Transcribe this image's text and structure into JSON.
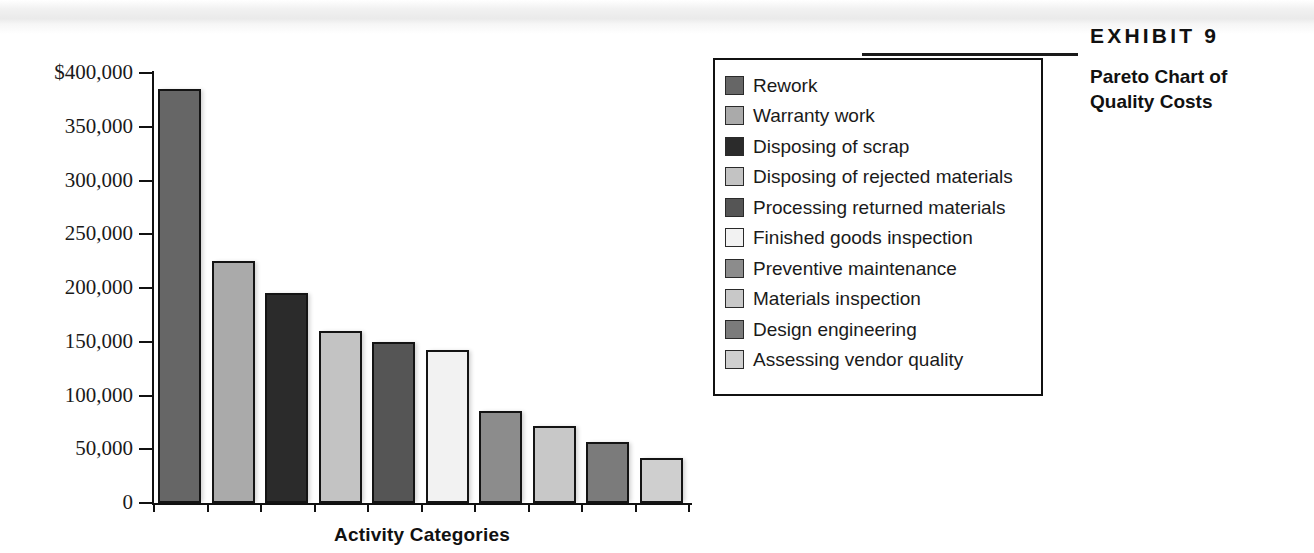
{
  "exhibit": {
    "number": "EXHIBIT 9",
    "title_line1": "Pareto Chart of",
    "title_line2": "Quality Costs"
  },
  "chart_data": {
    "type": "bar",
    "title": "Pareto Chart of Quality Costs",
    "xlabel": "Activity Categories",
    "ylabel": "",
    "ylim": [
      0,
      400000
    ],
    "grid": false,
    "legend_position": "right",
    "ytick_labels": [
      "$400,000",
      "350,000",
      "300,000",
      "250,000",
      "200,000",
      "150,000",
      "100,000",
      "50,000",
      "0"
    ],
    "ytick_values": [
      400000,
      350000,
      300000,
      250000,
      200000,
      150000,
      100000,
      50000,
      0
    ],
    "categories": [
      "Rework",
      "Warranty work",
      "Disposing of scrap",
      "Disposing of rejected materials",
      "Processing returned materials",
      "Finished goods inspection",
      "Preventive maintenance",
      "Materials inspection",
      "Design engineering",
      "Assessing vendor quality"
    ],
    "values": [
      385000,
      225000,
      195000,
      160000,
      150000,
      142000,
      86000,
      72000,
      57000,
      42000
    ],
    "colors": [
      "#666666",
      "#aaaaaa",
      "#2b2b2b",
      "#c3c3c3",
      "#555555",
      "#f2f2f2",
      "#8c8c8c",
      "#c8c8c8",
      "#7b7b7b",
      "#cfcfcf"
    ]
  },
  "legend": {
    "items": [
      {
        "label": "Rework",
        "color": "#666666"
      },
      {
        "label": "Warranty work",
        "color": "#aaaaaa"
      },
      {
        "label": "Disposing of scrap",
        "color": "#2b2b2b"
      },
      {
        "label": "Disposing of rejected materials",
        "color": "#c3c3c3"
      },
      {
        "label": "Processing returned materials",
        "color": "#555555"
      },
      {
        "label": "Finished goods inspection",
        "color": "#f2f2f2"
      },
      {
        "label": "Preventive maintenance",
        "color": "#8c8c8c"
      },
      {
        "label": "Materials inspection",
        "color": "#c8c8c8"
      },
      {
        "label": "Design engineering",
        "color": "#7b7b7b"
      },
      {
        "label": "Assessing vendor quality",
        "color": "#cfcfcf"
      }
    ]
  }
}
